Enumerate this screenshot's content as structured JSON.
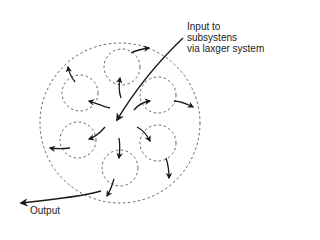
{
  "diagram": {
    "type": "subsystem-flow",
    "labels": {
      "input_line1": "Input to",
      "input_line2": "subsystens",
      "input_line3": "via laxger system",
      "output": "Output"
    },
    "outer_system": {
      "cx": 120,
      "cy": 123,
      "r": 80,
      "style": "dashed"
    },
    "subsystems": [
      {
        "id": "top",
        "cx": 122,
        "cy": 67,
        "r": 18
      },
      {
        "id": "upper-left",
        "cx": 80,
        "cy": 93,
        "r": 18
      },
      {
        "id": "upper-right",
        "cx": 158,
        "cy": 95,
        "r": 18
      },
      {
        "id": "lower-left",
        "cx": 78,
        "cy": 140,
        "r": 18
      },
      {
        "id": "lower-right",
        "cx": 158,
        "cy": 143,
        "r": 18
      },
      {
        "id": "bottom",
        "cx": 120,
        "cy": 168,
        "r": 18
      }
    ],
    "colors": {
      "line": "#1a1a1a",
      "dash": "#555555",
      "text": "#222222"
    }
  }
}
